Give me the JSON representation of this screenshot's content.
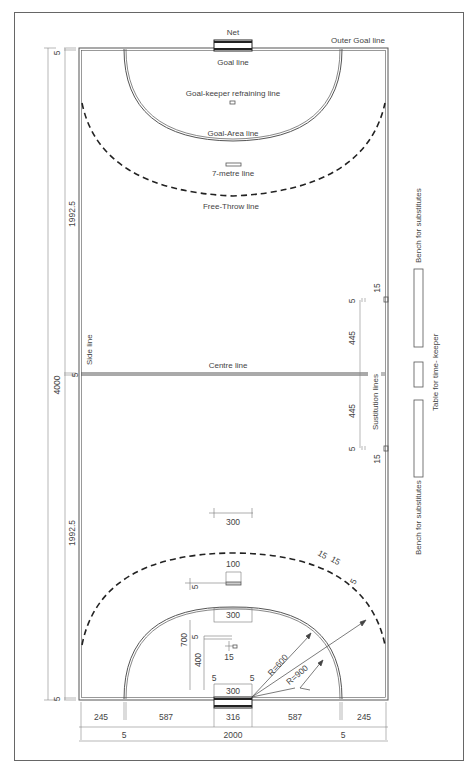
{
  "diagram": {
    "colors": {
      "line": "#555555",
      "dim_line": "#888888",
      "text": "#444444",
      "background": "#ffffff",
      "net": "#222222"
    },
    "labels": {
      "net": "Net",
      "outer_goal_line": "Outer Goal line",
      "goal_line": "Goal line",
      "goalkeeper_line": "Goal-keeper refraining line",
      "goal_area_line": "Goal-Area line",
      "seven_metre_line": "7-metre line",
      "free_throw_line": "Free-Throw line",
      "side_line": "Side line",
      "centre_line": "Centre line",
      "substitution_lines": "Sustitution lines",
      "bench_top": "Bench for substitutes",
      "bench_bottom": "Bench for substitutes",
      "timekeeper_table": "Table for time-  keeper"
    },
    "dimensions": {
      "left": {
        "total": "4000",
        "half_top": "1992.5",
        "half_bottom": "1992.5",
        "top_line": "5",
        "centre_line": "5",
        "bottom_line": "5"
      },
      "substitution": {
        "top_gap": "5",
        "top_len": "445",
        "bottom_len": "445",
        "bottom_gap": "5",
        "mark_top": "15",
        "mark_bottom": "15"
      },
      "bottom_row": [
        "245",
        "587",
        "316",
        "587",
        "245"
      ],
      "bottom_total": {
        "left_line": "5",
        "width": "2000",
        "right_line": "5"
      },
      "goal_area": {
        "free_throw_mark": "300",
        "seven_metre_width": "100",
        "seven_metre_thickness": "5",
        "goal_area_flat": "300",
        "goal_distance": "700",
        "goal_line_thickness": "5",
        "goalkeeper_distance": "400",
        "goalkeeper_mark": "15",
        "post_left": "5",
        "post_right": "5",
        "goal_width": "300",
        "radius_6m": "R=600",
        "radius_9m": "R=900",
        "dash_a": "15",
        "dash_b": "15",
        "dash_thick": "5"
      }
    }
  }
}
